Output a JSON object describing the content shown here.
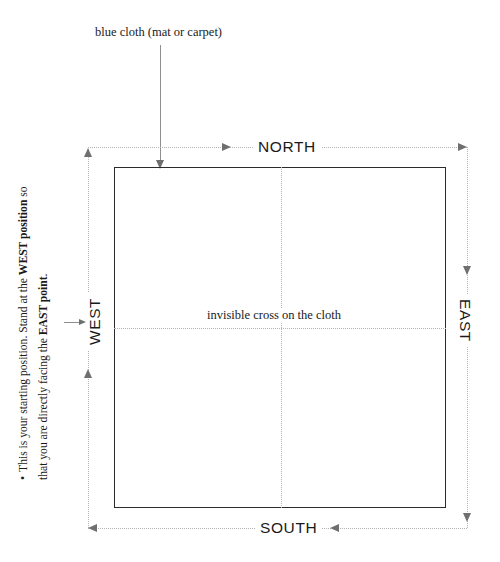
{
  "diagram": {
    "title_note": "blue cloth (mat or carpet)",
    "center_note": "invisible cross on the cloth",
    "directions": {
      "north": "NORTH",
      "south": "SOUTH",
      "east": "EAST",
      "west": "WEST"
    },
    "side_note": {
      "bullet": "•",
      "text_part1": "This is your starting position.  Stand at the ",
      "bold1": "WEST position",
      "text_part2": " so that you are directly facing the ",
      "bold2": "EAST point",
      "text_part3": "."
    },
    "colors": {
      "box_border": "#2b2b2b",
      "guide_dotted": "#b3b3b3",
      "arrow": "#6f6f6f",
      "text": "#1a1a1a",
      "background": "#ffffff"
    }
  }
}
